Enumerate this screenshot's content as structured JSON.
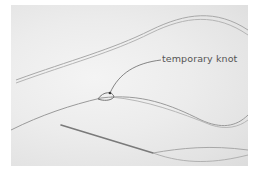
{
  "image": {
    "description": "Photo of two lengths of thread on a pale surface, with a temporary knot joining threads and a needle threaded at lower right",
    "annotation": {
      "label": "temporary knot"
    },
    "colors": {
      "background": "#ebebeb",
      "thread": "#9a9a9a",
      "needle": "#7a7a7a",
      "label_text": "#555555"
    }
  }
}
